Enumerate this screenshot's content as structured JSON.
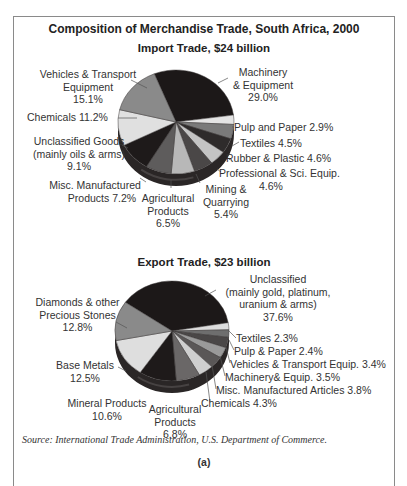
{
  "title": "Composition of Merchandise Trade, South Africa, 2000",
  "source": "Source: International Trade Administration, U.S. Department of Commerce.",
  "caption": "(a)",
  "import": {
    "subtitle": "Import Trade, $24 billion",
    "labels": {
      "vehicles": [
        "Vehicles & Transport",
        "Equipment",
        "15.1%"
      ],
      "chemicals": "Chemicals 11.2%",
      "unclassified": [
        "Unclassified Goods",
        "(mainly oils & arms)",
        "9.1%"
      ],
      "misc": [
        "Misc. Manufactured",
        "Products 7.2%"
      ],
      "agricultural": [
        "Agricultural",
        "Products",
        "6.5%"
      ],
      "mining": [
        "Mining &",
        "Quarrying",
        "5.4%"
      ],
      "professional": [
        "Professional & Sci. Equip.",
        "4.6%"
      ],
      "rubber": "Rubber & Plastic 4.6%",
      "textiles": "Textiles 4.5%",
      "pulp": "Pulp and Paper 2.9%",
      "machinery": [
        "Machinery",
        "& Equipment",
        "29.0%"
      ]
    }
  },
  "export": {
    "subtitle": "Export Trade, $23 billion",
    "labels": {
      "unclassified": [
        "Unclassified",
        "(mainly gold, platinum,",
        "uranium & arms)",
        "37.6%"
      ],
      "textiles": "Textiles 2.3%",
      "pulp": "Pulp & Paper 2.4%",
      "vehicles": "Vehicles & Transport Equip. 3.4%",
      "machinery": "Machinery& Equip. 3.5%",
      "misc": "Misc. Manufactured Articles 3.8%",
      "chemicals": "Chemicals 4.3%",
      "agricultural": [
        "Agricultural",
        "Products",
        "6.8%"
      ],
      "mineral": [
        "Mineral Products",
        "10.6%"
      ],
      "base_metals": [
        "Base Metals",
        "12.5%"
      ],
      "diamonds": [
        "Diamonds & other",
        "Precious Stones",
        "12.8%"
      ]
    }
  },
  "chart_data": [
    {
      "type": "pie",
      "title": "Import Trade, $24 billion",
      "categories": [
        "Machinery & Equipment",
        "Pulp and Paper",
        "Textiles",
        "Rubber & Plastic",
        "Professional & Sci. Equip.",
        "Mining & Quarrying",
        "Agricultural Products",
        "Misc. Manufactured Products",
        "Unclassified Goods (mainly oils & arms)",
        "Chemicals",
        "Vehicles & Transport Equipment"
      ],
      "values": [
        29.0,
        2.9,
        4.5,
        4.6,
        4.6,
        5.4,
        6.5,
        7.2,
        9.1,
        11.2,
        15.1
      ],
      "colors": [
        "#1c1818",
        "#e4e4e4",
        "#7a7a7a",
        "#2e2b2b",
        "#c4c4c4",
        "#4a4747",
        "#b8b8b8",
        "#5e5c5c",
        "#1e1a1a",
        "#e0e0e0",
        "#8a8a8a"
      ],
      "unit": "%",
      "style": "3d tilted pie"
    },
    {
      "type": "pie",
      "title": "Export Trade, $23 billion",
      "categories": [
        "Unclassified (mainly gold, platinum, uranium & arms)",
        "Textiles",
        "Pulp & Paper",
        "Vehicles & Transport Equip.",
        "Machinery& Equip.",
        "Misc. Manufactured Articles",
        "Chemicals",
        "Agricultural Products",
        "Mineral Products",
        "Base Metals",
        "Diamonds & other Precious Stones"
      ],
      "values": [
        37.6,
        2.3,
        2.4,
        3.4,
        3.5,
        3.8,
        4.3,
        6.8,
        10.6,
        12.5,
        12.8
      ],
      "colors": [
        "#1c1818",
        "#dcdcdc",
        "#6e6e6e",
        "#4a4747",
        "#9a9a9a",
        "#5a5757",
        "#cfcfcf",
        "#6a6767",
        "#1e1a1a",
        "#dedede",
        "#8a8a8a"
      ],
      "unit": "%",
      "style": "3d tilted pie"
    }
  ]
}
